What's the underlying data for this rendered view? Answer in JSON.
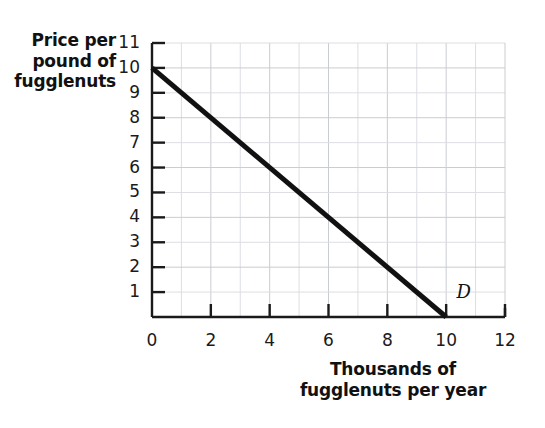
{
  "chart_data": {
    "type": "line",
    "title": "",
    "subtitle": "",
    "xlabel": "Thousands of fugglenuts per year",
    "ylabel": "Price per pound of fugglenuts",
    "xlim": [
      0,
      12
    ],
    "ylim": [
      0,
      11
    ],
    "grid": true,
    "grid_step_x": 1,
    "grid_step_y": 1,
    "legend_position": "inline-curve-label",
    "x_tick_labels": [
      "0",
      "2",
      "4",
      "6",
      "8",
      "10",
      "12"
    ],
    "x_tick_values": [
      0,
      2,
      4,
      6,
      8,
      10,
      12
    ],
    "y_tick_labels": [
      "1",
      "2",
      "3",
      "4",
      "5",
      "6",
      "7",
      "8",
      "9",
      "10",
      "11"
    ],
    "y_tick_values": [
      1,
      2,
      3,
      4,
      5,
      6,
      7,
      8,
      9,
      10,
      11
    ],
    "series": [
      {
        "name": "D",
        "label": "D",
        "color": "#111111",
        "linewidth": 5,
        "x": [
          0,
          10
        ],
        "y": [
          10,
          0
        ],
        "points": [
          {
            "x": 0,
            "y": 10
          },
          {
            "x": 1,
            "y": 9
          },
          {
            "x": 2,
            "y": 8
          },
          {
            "x": 3,
            "y": 7
          },
          {
            "x": 4,
            "y": 6
          },
          {
            "x": 5,
            "y": 5
          },
          {
            "x": 6,
            "y": 4
          },
          {
            "x": 7,
            "y": 3
          },
          {
            "x": 8,
            "y": 2
          },
          {
            "x": 9,
            "y": 1
          },
          {
            "x": 10,
            "y": 0
          }
        ]
      }
    ],
    "annotations": [
      {
        "text": "D",
        "x": 10.35,
        "y": 0.75,
        "style": "italic-serif"
      }
    ]
  },
  "axis_titles": {
    "y_lines": [
      "Price per",
      "pound of",
      "fugglenuts"
    ],
    "x_lines": [
      "Thousands of",
      "fugglenuts per year"
    ]
  },
  "colors": {
    "background": "#ffffff",
    "axis": "#1a1a1a",
    "grid": "#c9ccd1",
    "grid_faint": "#dcdee2",
    "curve": "#111111",
    "text": "#111111"
  }
}
